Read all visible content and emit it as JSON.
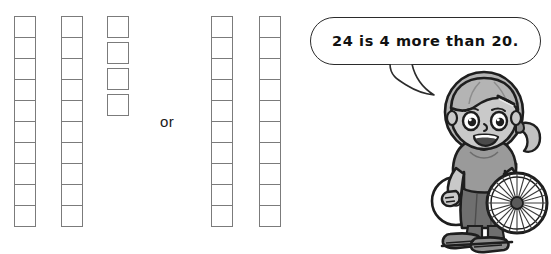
{
  "worksheet": {
    "title": "Comparing 24 and 20 with base-ten blocks",
    "or_label": "or"
  },
  "left_group": {
    "name": "twenty-four",
    "total": 24,
    "columns": [
      {
        "label": "ten-rod-1",
        "count": 10
      },
      {
        "label": "ten-rod-2",
        "count": 10
      }
    ],
    "loose_units": {
      "label": "ones-units",
      "count": 4
    }
  },
  "right_group": {
    "name": "twenty",
    "total": 20,
    "columns": [
      {
        "label": "ten-rod-1",
        "count": 10
      },
      {
        "label": "ten-rod-2",
        "count": 10
      }
    ]
  },
  "speech": {
    "text": "24 is 4 more than 20."
  },
  "character": {
    "description": "girl in wheelchair",
    "hair": "bangs with hair clip and side ponytail",
    "expression": "smiling"
  },
  "colors": {
    "cell_border": "#7b7b7b",
    "bubble_border": "#2b2b2b",
    "text": "#111111",
    "skin": "#c9c9c9",
    "hair": "#b4b4b4",
    "shirt": "#9a9a9a",
    "skirt": "#6f6f6f",
    "outline": "#1e1e1e",
    "background": "#ffffff"
  }
}
